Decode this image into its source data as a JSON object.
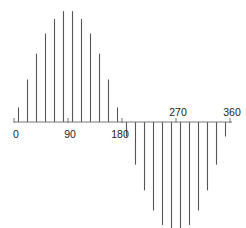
{
  "chart_data": {
    "type": "stem",
    "title": "",
    "xlabel": "",
    "ylabel": "",
    "function": "sin(x)",
    "x_unit": "degrees",
    "xlim": [
      0,
      360
    ],
    "ylim": [
      -1,
      1
    ],
    "grid": false,
    "legend": null,
    "x_ticks": [
      {
        "value": 0,
        "label": "0",
        "label_position": "below"
      },
      {
        "value": 90,
        "label": "90",
        "label_position": "below"
      },
      {
        "value": 180,
        "label": "180",
        "label_position": "below"
      },
      {
        "value": 270,
        "label": "270",
        "label_position": "above"
      },
      {
        "value": 360,
        "label": "360",
        "label_position": "above"
      }
    ],
    "x": [
      7.5,
      22.5,
      37.5,
      52.5,
      67.5,
      82.5,
      97.5,
      112.5,
      127.5,
      142.5,
      157.5,
      172.5,
      187.5,
      202.5,
      217.5,
      232.5,
      247.5,
      262.5,
      277.5,
      292.5,
      307.5,
      322.5,
      337.5,
      352.5
    ],
    "values": [
      0.13,
      0.38,
      0.61,
      0.79,
      0.92,
      0.99,
      0.99,
      0.92,
      0.79,
      0.61,
      0.38,
      0.13,
      -0.13,
      -0.38,
      -0.61,
      -0.79,
      -0.92,
      -0.99,
      -0.99,
      -0.92,
      -0.79,
      -0.61,
      -0.38,
      -0.13
    ],
    "colors": {
      "stem": "#555555",
      "axis": "#777777",
      "text": "#222222"
    }
  }
}
